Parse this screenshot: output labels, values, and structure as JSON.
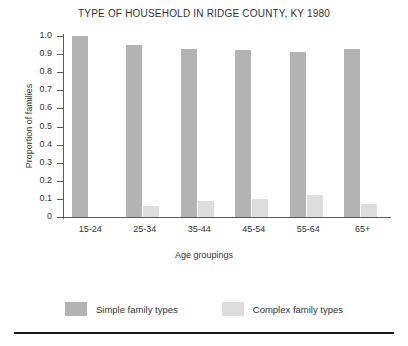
{
  "chart_data": {
    "type": "bar",
    "title": "TYPE OF HOUSEHOLD IN RIDGE COUNTY, KY 1980",
    "xlabel": "Age groupings",
    "ylabel": "Proportion of families",
    "categories": [
      "15-24",
      "25-34",
      "35-44",
      "45-54",
      "55-64",
      "65+"
    ],
    "series": [
      {
        "name": "Simple family types",
        "color": "#b3b3b3",
        "values": [
          1.0,
          0.95,
          0.93,
          0.92,
          0.91,
          0.93
        ]
      },
      {
        "name": "Complex family types",
        "color": "#dddddd",
        "values": [
          0.0,
          0.06,
          0.09,
          0.1,
          0.12,
          0.07
        ]
      }
    ],
    "ylim": [
      0,
      1.0
    ],
    "ytick_labels": [
      "1.0",
      "0.9",
      "0.8",
      "0.7",
      "0.6",
      "0.5",
      "0.4",
      "0.3",
      "0.2",
      "0.1",
      "0"
    ],
    "ytick_values": [
      1.0,
      0.9,
      0.8,
      0.7,
      0.6,
      0.5,
      0.4,
      0.3,
      0.2,
      0.1,
      0.0
    ],
    "grid": false,
    "legend_position": "bottom"
  }
}
